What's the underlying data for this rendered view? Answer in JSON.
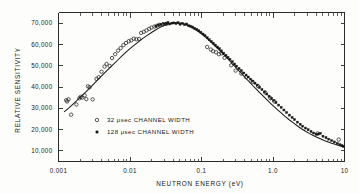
{
  "chart_data": {
    "type": "scatter",
    "title": "",
    "xlabel": "NEUTRON ENERGY  (eV)",
    "ylabel": "RELATIVE SENSITIVITY",
    "xscale": "log",
    "yscale": "linear",
    "xlim": [
      0.001,
      10
    ],
    "ylim": [
      5000,
      75000
    ],
    "grid": false,
    "legend_position": "center-left",
    "x_tick_labels": [
      "0.001",
      "0.01",
      "0.1",
      "1.0",
      "10"
    ],
    "x_tick_values": [
      0.001,
      0.01,
      0.1,
      1,
      10
    ],
    "y_tick_labels": [
      "10,000",
      "20,000",
      "30,000",
      "40,000",
      "50,000",
      "60,000",
      "70,000"
    ],
    "y_tick_values": [
      10000,
      20000,
      30000,
      40000,
      50000,
      60000,
      70000
    ],
    "series": [
      {
        "name": "32 μsec CHANNEL WIDTH",
        "marker": "open-circle",
        "points": [
          [
            0.00128,
            33800
          ],
          [
            0.00132,
            33200
          ],
          [
            0.00138,
            34200
          ],
          [
            0.0015,
            27000
          ],
          [
            0.00178,
            31800
          ],
          [
            0.00196,
            34700
          ],
          [
            0.00205,
            35400
          ],
          [
            0.00215,
            35000
          ],
          [
            0.00232,
            36100
          ],
          [
            0.00245,
            34300
          ],
          [
            0.00258,
            40300
          ],
          [
            0.00272,
            39900
          ],
          [
            0.003,
            34200
          ],
          [
            0.0034,
            43800
          ],
          [
            0.00365,
            44600
          ],
          [
            0.004,
            47200
          ],
          [
            0.0044,
            49600
          ],
          [
            0.0047,
            50800
          ],
          [
            0.0052,
            49900
          ],
          [
            0.0056,
            53600
          ],
          [
            0.0062,
            55400
          ],
          [
            0.0068,
            57100
          ],
          [
            0.0074,
            58300
          ],
          [
            0.0081,
            59700
          ],
          [
            0.0088,
            60700
          ],
          [
            0.0096,
            61500
          ],
          [
            0.0104,
            61900
          ],
          [
            0.0113,
            62700
          ],
          [
            0.0123,
            62400
          ],
          [
            0.0134,
            62600
          ],
          [
            0.0143,
            65400
          ],
          [
            0.0156,
            65900
          ],
          [
            0.017,
            66600
          ],
          [
            0.0185,
            67300
          ],
          [
            0.02,
            67900
          ],
          [
            0.022,
            68400
          ],
          [
            0.024,
            68800
          ],
          [
            0.026,
            69200
          ],
          [
            0.029,
            69400
          ],
          [
            0.032,
            69600
          ],
          [
            0.12,
            58800
          ],
          [
            0.135,
            57600
          ],
          [
            0.145,
            56800
          ],
          [
            0.16,
            56300
          ],
          [
            0.175,
            55400
          ],
          [
            0.19,
            55800
          ],
          [
            0.21,
            53700
          ],
          [
            0.26,
            50200
          ],
          [
            0.3,
            47700
          ],
          [
            0.36,
            46300
          ],
          [
            0.42,
            44600
          ],
          [
            0.52,
            42400
          ],
          [
            0.62,
            40400
          ],
          [
            0.78,
            37400
          ],
          [
            0.92,
            34800
          ],
          [
            1.05,
            33200
          ],
          [
            4.2,
            18200
          ],
          [
            8.3,
            15300
          ]
        ]
      },
      {
        "name": "128 μsec CHANNEL WIDTH",
        "marker": "filled-square",
        "points": [
          [
            0.023,
            68600
          ],
          [
            0.025,
            69100
          ],
          [
            0.027,
            69400
          ],
          [
            0.0295,
            69700
          ],
          [
            0.032,
            69900
          ],
          [
            0.034,
            70300
          ],
          [
            0.036,
            69600
          ],
          [
            0.0385,
            70000
          ],
          [
            0.041,
            70100
          ],
          [
            0.044,
            69800
          ],
          [
            0.047,
            70200
          ],
          [
            0.05,
            69500
          ],
          [
            0.054,
            69900
          ],
          [
            0.058,
            69300
          ],
          [
            0.062,
            69600
          ],
          [
            0.066,
            68800
          ],
          [
            0.07,
            68600
          ],
          [
            0.075,
            68200
          ],
          [
            0.08,
            67600
          ],
          [
            0.086,
            67100
          ],
          [
            0.092,
            66400
          ],
          [
            0.098,
            65700
          ],
          [
            0.105,
            64900
          ],
          [
            0.112,
            64100
          ],
          [
            0.12,
            63200
          ],
          [
            0.128,
            62200
          ],
          [
            0.137,
            61400
          ],
          [
            0.146,
            60600
          ],
          [
            0.156,
            59700
          ],
          [
            0.167,
            58800
          ],
          [
            0.178,
            58000
          ],
          [
            0.19,
            57000
          ],
          [
            0.205,
            55900
          ],
          [
            0.22,
            54900
          ],
          [
            0.235,
            53900
          ],
          [
            0.25,
            53000
          ],
          [
            0.27,
            51900
          ],
          [
            0.29,
            50800
          ],
          [
            0.31,
            49800
          ],
          [
            0.335,
            48700
          ],
          [
            0.36,
            47700
          ],
          [
            0.39,
            46600
          ],
          [
            0.42,
            45600
          ],
          [
            0.45,
            44700
          ],
          [
            0.485,
            43700
          ],
          [
            0.52,
            42800
          ],
          [
            0.56,
            41800
          ],
          [
            0.6,
            40900
          ],
          [
            0.65,
            39800
          ],
          [
            0.7,
            38800
          ],
          [
            0.76,
            37700
          ],
          [
            0.82,
            36700
          ],
          [
            0.88,
            35700
          ],
          [
            0.95,
            34700
          ],
          [
            1.02,
            33700
          ],
          [
            1.1,
            32700
          ],
          [
            1.2,
            31500
          ],
          [
            1.3,
            30400
          ],
          [
            1.42,
            29200
          ],
          [
            1.55,
            28000
          ],
          [
            1.7,
            26800
          ],
          [
            1.85,
            25700
          ],
          [
            2.0,
            24700
          ],
          [
            2.2,
            23500
          ],
          [
            2.4,
            22500
          ],
          [
            2.6,
            21600
          ],
          [
            2.85,
            20700
          ],
          [
            3.1,
            19900
          ],
          [
            3.4,
            19100
          ],
          [
            3.7,
            18400
          ],
          [
            4.0,
            17800
          ],
          [
            4.3,
            17900
          ],
          [
            4.6,
            18200
          ],
          [
            5.0,
            16900
          ],
          [
            5.5,
            16200
          ],
          [
            6.0,
            15500
          ],
          [
            6.6,
            14800
          ],
          [
            7.2,
            14200
          ],
          [
            7.9,
            13500
          ],
          [
            8.6,
            12900
          ],
          [
            9.2,
            12500
          ],
          [
            9.6,
            12200
          ]
        ]
      }
    ],
    "fit_curve": {
      "name": "smooth fit",
      "points": [
        [
          0.0012,
          28300
        ],
        [
          0.0014,
          30200
        ],
        [
          0.0016,
          32000
        ],
        [
          0.0018,
          33600
        ],
        [
          0.002,
          35100
        ],
        [
          0.0023,
          37000
        ],
        [
          0.0026,
          38800
        ],
        [
          0.003,
          40900
        ],
        [
          0.0035,
          43200
        ],
        [
          0.004,
          45200
        ],
        [
          0.0046,
          47200
        ],
        [
          0.0052,
          49000
        ],
        [
          0.006,
          51000
        ],
        [
          0.0068,
          52800
        ],
        [
          0.0078,
          54700
        ],
        [
          0.0088,
          56400
        ],
        [
          0.01,
          58000
        ],
        [
          0.0115,
          59700
        ],
        [
          0.013,
          61100
        ],
        [
          0.015,
          62700
        ],
        [
          0.017,
          64000
        ],
        [
          0.02,
          65600
        ],
        [
          0.023,
          66900
        ],
        [
          0.026,
          67900
        ],
        [
          0.03,
          68900
        ],
        [
          0.034,
          69600
        ],
        [
          0.038,
          70000
        ],
        [
          0.042,
          70200
        ],
        [
          0.046,
          70200
        ],
        [
          0.05,
          70000
        ],
        [
          0.055,
          69700
        ],
        [
          0.06,
          69300
        ],
        [
          0.066,
          68700
        ],
        [
          0.072,
          68100
        ],
        [
          0.08,
          67200
        ],
        [
          0.088,
          66300
        ],
        [
          0.096,
          65400
        ],
        [
          0.105,
          64400
        ],
        [
          0.115,
          63300
        ],
        [
          0.125,
          62200
        ],
        [
          0.135,
          61200
        ],
        [
          0.15,
          59700
        ],
        [
          0.165,
          58400
        ],
        [
          0.18,
          57100
        ],
        [
          0.2,
          55600
        ],
        [
          0.22,
          54100
        ],
        [
          0.24,
          52800
        ],
        [
          0.27,
          50900
        ],
        [
          0.3,
          49300
        ],
        [
          0.34,
          47300
        ],
        [
          0.38,
          45600
        ],
        [
          0.42,
          44000
        ],
        [
          0.47,
          42300
        ],
        [
          0.52,
          40700
        ],
        [
          0.58,
          39100
        ],
        [
          0.65,
          37400
        ],
        [
          0.72,
          35900
        ],
        [
          0.8,
          34400
        ],
        [
          0.9,
          32700
        ],
        [
          1.0,
          31300
        ],
        [
          1.15,
          29400
        ],
        [
          1.3,
          27800
        ],
        [
          1.5,
          26000
        ],
        [
          1.7,
          24500
        ],
        [
          1.95,
          23000
        ],
        [
          2.2,
          21700
        ],
        [
          2.5,
          20400
        ],
        [
          2.85,
          19200
        ],
        [
          3.2,
          18200
        ],
        [
          3.6,
          17300
        ],
        [
          4.1,
          16400
        ],
        [
          4.6,
          15700
        ],
        [
          5.2,
          14900
        ],
        [
          5.9,
          14200
        ],
        [
          6.6,
          13600
        ],
        [
          7.4,
          13100
        ],
        [
          8.3,
          12500
        ],
        [
          9.2,
          12100
        ],
        [
          10.0,
          11700
        ]
      ]
    }
  },
  "axes": {
    "y_title": "RELATIVE SENSITIVITY",
    "x_title": "NEUTRON ENERGY  (eV)"
  },
  "legend": {
    "entries": [
      {
        "label": "32  μsec  CHANNEL WIDTH",
        "marker": "open-circle"
      },
      {
        "label": "128  μsec  CHANNEL WIDTH",
        "marker": "filled-square"
      }
    ]
  }
}
